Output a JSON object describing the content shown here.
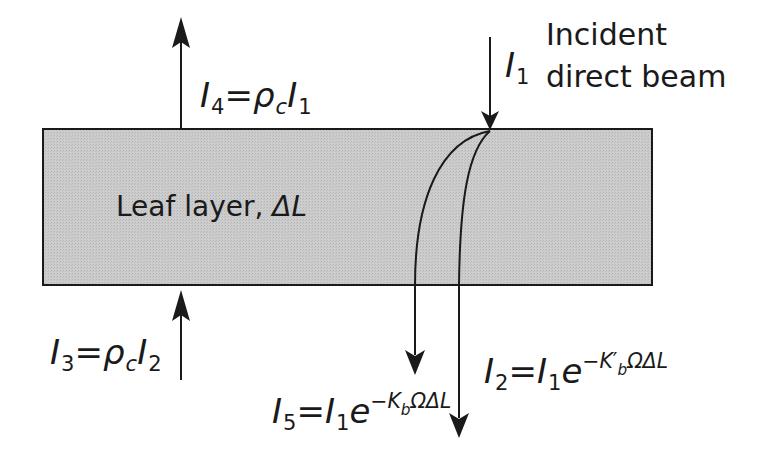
{
  "diagram": {
    "layer_label": {
      "text": "Leaf layer, ",
      "symbol": "ΔL"
    },
    "incident_label": {
      "line1": "Incident",
      "line2": "direct beam"
    },
    "I1": {
      "var": "I",
      "sub": "1"
    },
    "I4": {
      "var": "I",
      "sub": "4",
      "equals": "=",
      "rho": "ρ",
      "rho_sub": "c",
      "rhs_var": "I",
      "rhs_sub": "1"
    },
    "I3": {
      "var": "I",
      "sub": "3",
      "equals": "=",
      "rho": "ρ",
      "rho_sub": "c",
      "rhs_var": "I",
      "rhs_sub": "2"
    },
    "I5": {
      "var": "I",
      "sub": "5",
      "equals": "=",
      "rhs_var": "I",
      "rhs_sub": "1",
      "base": "e",
      "exp_minus": "−",
      "exp_K": "K",
      "exp_K_sub": "b",
      "exp_rest": "ΩΔL"
    },
    "I2": {
      "var": "I",
      "sub": "2",
      "equals": "=",
      "rhs_var": "I",
      "rhs_sub": "1",
      "base": "e",
      "exp_minus": "−",
      "exp_K": "K",
      "exp_K_prime": "′",
      "exp_K_sub": "b",
      "exp_rest": "ΩΔL"
    },
    "colors": {
      "layer_fill": "#c8c8c8",
      "stroke": "#1a1a1a"
    }
  }
}
